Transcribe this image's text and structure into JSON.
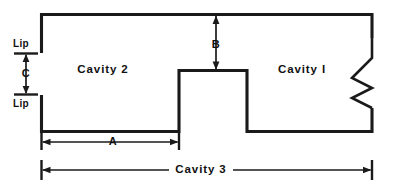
{
  "diagram": {
    "line_color": "#1a1a1a",
    "background_color": "#ffffff",
    "regions": [
      {
        "key": "cavity_2",
        "label": "Cavity 2",
        "x": 103,
        "y": 70
      },
      {
        "key": "cavity_1",
        "label": "Cavity I",
        "x": 302,
        "y": 70
      }
    ],
    "dimensions": [
      {
        "key": "a",
        "label": "A",
        "orientation": "horizontal",
        "x": 113,
        "y": 141
      },
      {
        "key": "b",
        "label": "B",
        "orientation": "vertical",
        "x": 216,
        "y": 44
      },
      {
        "key": "c",
        "label": "C",
        "orientation": "vertical",
        "x": 26,
        "y": 73
      },
      {
        "key": "cavity_3",
        "label": "Cavity 3",
        "orientation": "horizontal",
        "x": 201,
        "y": 170
      }
    ],
    "annotations": [
      {
        "key": "lip_upper",
        "label": "Lip",
        "x": 21,
        "y": 44
      },
      {
        "key": "lip_lower",
        "label": "Lip",
        "x": 21,
        "y": 104
      }
    ],
    "break_symbol": {
      "key": "break-line",
      "side": "right",
      "note": "zigzag break line on right wall"
    }
  }
}
